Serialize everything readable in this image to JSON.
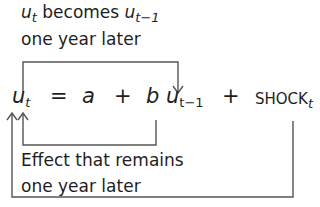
{
  "top_caption": {
    "var": "u",
    "var_sub": "t",
    "middle": " becomes ",
    "var2": "u",
    "var2_sub": "t−1",
    "line2": "one year later"
  },
  "equation": {
    "lhs": "u",
    "lhs_sub": "t",
    "equals": "=",
    "a": "a",
    "plus1": "+",
    "b": "b",
    "u_lag": "u",
    "u_lag_sub": "t−1",
    "plus2": "+",
    "shock": "SHOCK",
    "shock_sub": "t"
  },
  "bottom_caption": {
    "line1": "Effect that remains",
    "line2": "one year later"
  },
  "colors": {
    "line": "#555555",
    "text": "#1e1e1e"
  }
}
